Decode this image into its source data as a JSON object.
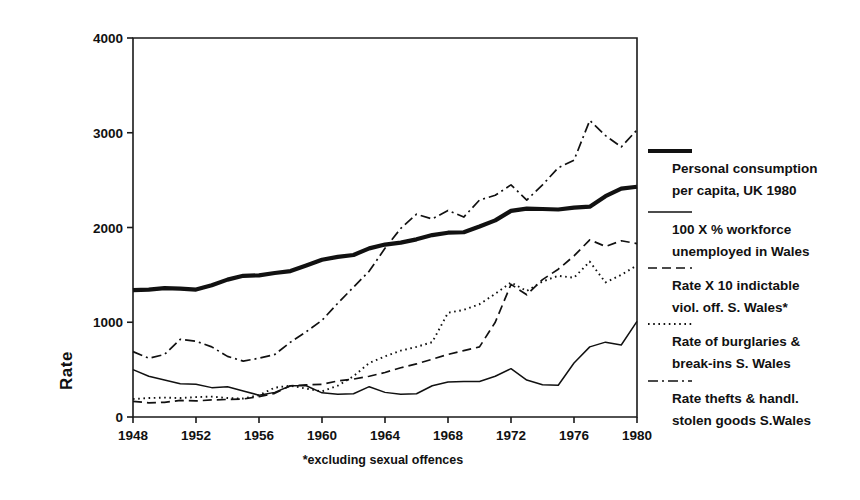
{
  "chart_data": {
    "type": "line",
    "title": "",
    "xlabel": "",
    "ylabel": "Rate",
    "xlim": [
      1948,
      1980
    ],
    "xticks": [
      1948,
      1952,
      1956,
      1960,
      1964,
      1968,
      1972,
      1976,
      1980
    ],
    "xtick_labels": [
      "1948",
      "1952",
      "1956",
      "1960",
      "1964",
      "1968",
      "1972",
      "1976",
      "1980"
    ],
    "ylim": [
      0,
      4000
    ],
    "yticks": [
      0,
      1000,
      2000,
      3000,
      4000
    ],
    "ytick_labels": [
      "0",
      "1000",
      "2000",
      "3000",
      "4000"
    ],
    "grid": false,
    "legend_position": "right",
    "footnote": "*excluding sexual offences",
    "x": [
      1948,
      1949,
      1950,
      1951,
      1952,
      1953,
      1954,
      1955,
      1956,
      1957,
      1958,
      1959,
      1960,
      1961,
      1962,
      1963,
      1964,
      1965,
      1966,
      1967,
      1968,
      1969,
      1970,
      1971,
      1972,
      1973,
      1974,
      1975,
      1976,
      1977,
      1978,
      1979,
      1980
    ],
    "series": [
      {
        "name": "Personal consumption per capita, UK 1980",
        "style": "solid-thick",
        "values": [
          1340,
          1345,
          1360,
          1355,
          1345,
          1390,
          1450,
          1490,
          1495,
          1520,
          1540,
          1600,
          1660,
          1690,
          1710,
          1780,
          1820,
          1840,
          1875,
          1920,
          1945,
          1950,
          2010,
          2075,
          2175,
          2200,
          2195,
          2190,
          2210,
          2220,
          2330,
          2410,
          2430
        ]
      },
      {
        "name": "100 X % workforce unemployed in Wales",
        "style": "solid-thin",
        "values": [
          500,
          430,
          390,
          350,
          345,
          310,
          320,
          275,
          230,
          260,
          330,
          330,
          255,
          240,
          245,
          320,
          260,
          240,
          245,
          330,
          370,
          375,
          375,
          430,
          510,
          390,
          340,
          335,
          570,
          740,
          790,
          760,
          1010
        ]
      },
      {
        "name": "Rate X 10 indictable viol. off. S. Wales*",
        "style": "dashed",
        "values": [
          165,
          150,
          155,
          175,
          170,
          180,
          185,
          190,
          215,
          250,
          330,
          340,
          345,
          380,
          400,
          430,
          470,
          520,
          560,
          610,
          660,
          700,
          740,
          1000,
          1400,
          1290,
          1450,
          1560,
          1700,
          1870,
          1800,
          1860,
          1830
        ]
      },
      {
        "name": "Rate of burglaries & break-ins S. Wales",
        "style": "dotted",
        "values": [
          190,
          200,
          205,
          200,
          210,
          215,
          200,
          195,
          230,
          310,
          330,
          300,
          270,
          330,
          430,
          570,
          640,
          700,
          740,
          790,
          1100,
          1130,
          1190,
          1300,
          1420,
          1330,
          1430,
          1490,
          1470,
          1640,
          1420,
          1500,
          1600
        ]
      },
      {
        "name": "Rate thefts & handl. stolen goods S.Wales",
        "style": "dashdot",
        "values": [
          690,
          620,
          660,
          820,
          800,
          740,
          640,
          590,
          620,
          660,
          790,
          900,
          1020,
          1200,
          1370,
          1540,
          1780,
          1990,
          2140,
          2090,
          2180,
          2110,
          2290,
          2340,
          2450,
          2290,
          2450,
          2630,
          2710,
          3130,
          2970,
          2850,
          3030
        ]
      }
    ]
  },
  "axis": {
    "ylabel": "Rate"
  },
  "legend": {
    "items": [
      {
        "line1": "Personal consumption",
        "line2": "per capita, UK 1980",
        "style": "solid-thick"
      },
      {
        "line1": "100 X % workforce",
        "line2": "unemployed in Wales",
        "style": "solid-thin"
      },
      {
        "line1": "Rate X 10 indictable",
        "line2": "viol. off. S. Wales*",
        "style": "dashed"
      },
      {
        "line1": "Rate of burglaries &",
        "line2": "break-ins S. Wales",
        "style": "dotted"
      },
      {
        "line1": "Rate thefts & handl.",
        "line2": "stolen goods S.Wales",
        "style": "dashdot"
      }
    ]
  },
  "footnote": {
    "text": "*excluding sexual offences"
  },
  "colors": {
    "ink": "#111111",
    "background": "#ffffff"
  }
}
